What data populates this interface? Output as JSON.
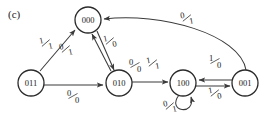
{
  "figure": {
    "panel_label": "(c)",
    "type": "state-transition-diagram",
    "stroke_color": "#3a3a3a",
    "text_color": "#1a1a1a",
    "background": "#ffffff"
  },
  "nodes": [
    {
      "id": "s000",
      "label": "000",
      "cx": 88,
      "cy": 20,
      "r": 13
    },
    {
      "id": "s011",
      "label": "011",
      "cx": 31,
      "cy": 83,
      "r": 13
    },
    {
      "id": "s010",
      "label": "010",
      "cx": 119,
      "cy": 83,
      "r": 13
    },
    {
      "id": "s100",
      "label": "100",
      "cx": 183,
      "cy": 83,
      "r": 13
    },
    {
      "id": "s001",
      "label": "001",
      "cx": 245,
      "cy": 83,
      "r": 13
    }
  ],
  "edges": [
    {
      "id": "e-011-000",
      "from": "011",
      "to": "000",
      "input": "1",
      "output": "1",
      "label": "1/1",
      "lx": 46,
      "ly": 44
    },
    {
      "id": "e-010-000",
      "from": "010",
      "to": "000",
      "input": "0",
      "output": "1",
      "label": "0/1",
      "lx": 66,
      "ly": 50
    },
    {
      "id": "e-000-010",
      "from": "000",
      "to": "010",
      "input": "1",
      "output": "0",
      "label": "1/0",
      "lx": 110,
      "ly": 42
    },
    {
      "id": "e-011-010",
      "from": "011",
      "to": "010",
      "input": "0",
      "output": "0",
      "label": "0/0",
      "lx": 73,
      "ly": 97
    },
    {
      "id": "e-010-100",
      "from": "010",
      "to": "100",
      "input": "0",
      "output": "0",
      "label": "0/0",
      "lx": 135,
      "ly": 66
    },
    {
      "id": "e-010-100b",
      "from": "010",
      "to": "100",
      "input": "1",
      "output": "1",
      "label": "1/1",
      "lx": 153,
      "ly": 64
    },
    {
      "id": "e-100-self",
      "from": "100",
      "to": "100",
      "input": "0",
      "output": "1",
      "label": "0/1",
      "lx": 170,
      "ly": 107
    },
    {
      "id": "e-001-100",
      "from": "001",
      "to": "100",
      "input": "1",
      "output": "0",
      "label": "1/0",
      "lx": 215,
      "ly": 62
    },
    {
      "id": "e-100-001",
      "from": "100",
      "to": "001",
      "input": "1",
      "output": "0",
      "label": "1/0",
      "lx": 215,
      "ly": 94
    },
    {
      "id": "e-001-000",
      "from": "001",
      "to": "000",
      "input": "0",
      "output": "1",
      "label": "0/1",
      "lx": 187,
      "ly": 19
    }
  ]
}
